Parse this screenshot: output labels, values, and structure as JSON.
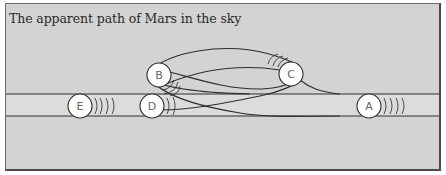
{
  "title": "The apparent path of Mars in the sky",
  "colors": {
    "panel_fill": "#d3d3d3",
    "band_fill": "#dcdcdc",
    "line": "#2e2e2e",
    "marker_fill": "#ffffff"
  },
  "positions": [
    {
      "label": "A",
      "x": 369,
      "y": 106,
      "arcs": 4,
      "arc_dir": "right"
    },
    {
      "label": "B",
      "x": 159,
      "y": 75,
      "arcs": 3,
      "arc_dir": "lower-right"
    },
    {
      "label": "C",
      "x": 291,
      "y": 74,
      "arcs": 4,
      "arc_dir": "upper-left"
    },
    {
      "label": "D",
      "x": 152,
      "y": 106,
      "arcs": 2,
      "arc_dir": "right"
    },
    {
      "label": "E",
      "x": 80,
      "y": 106,
      "arcs": 4,
      "arc_dir": "right"
    }
  ]
}
